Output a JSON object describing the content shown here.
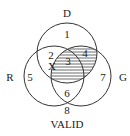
{
  "diagram": {
    "type": "venn-3-set",
    "sets": [
      {
        "label": "D",
        "cx": 67,
        "cy": 53,
        "r": 30
      },
      {
        "label": "R",
        "cx": 54,
        "cy": 76,
        "r": 30
      },
      {
        "label": "G",
        "cx": 81,
        "cy": 76,
        "r": 30
      }
    ],
    "regions": [
      {
        "id": "1",
        "x": 67,
        "y": 38
      },
      {
        "id": "2",
        "x": 50,
        "y": 59
      },
      {
        "id": "3",
        "x": 67,
        "y": 66
      },
      {
        "id": "4",
        "x": 85,
        "y": 57
      },
      {
        "id": "5",
        "x": 30,
        "y": 80
      },
      {
        "id": "6",
        "x": 67,
        "y": 96
      },
      {
        "id": "7",
        "x": 103,
        "y": 80
      },
      {
        "id": "8",
        "x": 67,
        "y": 114
      }
    ],
    "marker": {
      "label": "X",
      "x": 51,
      "y": 70
    },
    "shaded_regions": [
      "3",
      "4"
    ],
    "universe_label": "VALID",
    "set_labels": {
      "D": {
        "x": 67,
        "y": 17
      },
      "R": {
        "x": 10,
        "y": 81
      },
      "G": {
        "x": 123,
        "y": 81
      }
    },
    "line_color": "#333333"
  }
}
